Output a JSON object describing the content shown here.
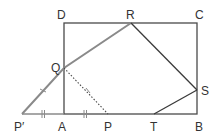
{
  "diagram": {
    "title": "",
    "colors": {
      "background": "#ffffff",
      "rectangle": "#4a4a4a",
      "fold_line": "#8a8a8a",
      "dotted_line": "#4a4a4a",
      "polygon_edges": "#3a3a3a",
      "tick_marks": "#8a8a8a",
      "labels": "#333333"
    },
    "points": {
      "A": {
        "label": "A",
        "x": 64,
        "y": 114
      },
      "B": {
        "label": "B",
        "x": 197,
        "y": 114
      },
      "C": {
        "label": "C",
        "x": 197,
        "y": 23
      },
      "D": {
        "label": "D",
        "x": 64,
        "y": 23
      },
      "R": {
        "label": "R",
        "x": 131,
        "y": 23
      },
      "Q": {
        "label": "Q",
        "x": 64,
        "y": 68
      },
      "S": {
        "label": "S",
        "x": 197,
        "y": 90
      },
      "T": {
        "label": "T",
        "x": 154,
        "y": 114
      },
      "P": {
        "label": "P",
        "x": 108,
        "y": 114
      },
      "P_prime": {
        "label": "P′",
        "x": 22,
        "y": 114
      }
    },
    "segments": [
      {
        "from": "A",
        "to": "B",
        "style": "solid"
      },
      {
        "from": "B",
        "to": "C",
        "style": "solid"
      },
      {
        "from": "C",
        "to": "D",
        "style": "solid"
      },
      {
        "from": "D",
        "to": "A",
        "style": "solid"
      },
      {
        "from": "P_prime",
        "to": "A",
        "style": "solid-light"
      },
      {
        "from": "P_prime",
        "to": "Q",
        "style": "solid-light"
      },
      {
        "from": "Q",
        "to": "R",
        "style": "solid-light"
      },
      {
        "from": "Q",
        "to": "P",
        "style": "dotted"
      },
      {
        "from": "R",
        "to": "S",
        "style": "solid"
      },
      {
        "from": "S",
        "to": "T",
        "style": "solid"
      }
    ],
    "tick_marks": [
      {
        "segment": "P_prime-Q",
        "count": 1
      },
      {
        "segment": "Q-P",
        "count": 1
      },
      {
        "segment": "P_prime-A",
        "count": 2
      },
      {
        "segment": "A-P",
        "count": 2
      }
    ]
  }
}
